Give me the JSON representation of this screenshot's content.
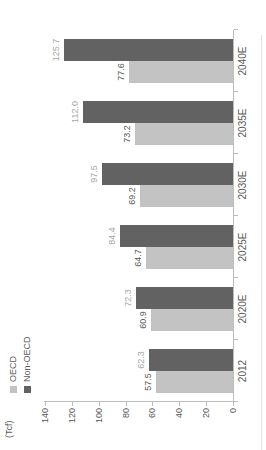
{
  "chart_data": {
    "type": "bar",
    "unit_label": "(Tcf)",
    "categories": [
      "2012",
      "2020E",
      "2025E",
      "2030E",
      "2035E",
      "2040E"
    ],
    "series": [
      {
        "name": "OECD",
        "color": "#c3c3c3",
        "label_color": "#595959",
        "values": [
          57.5,
          60.9,
          64.7,
          69.2,
          73.2,
          77.6
        ]
      },
      {
        "name": "Non-OECD",
        "color": "#626262",
        "label_color": "#a6a6a6",
        "values": [
          62.3,
          72.3,
          84.4,
          97.5,
          112.0,
          125.7
        ]
      }
    ],
    "ylim": [
      0,
      140
    ],
    "yticks": [
      0,
      20,
      40,
      60,
      80,
      100,
      120,
      140
    ],
    "grid": false,
    "legend_position": "top-left",
    "axis_color": "#bdbdbd",
    "text_color": "#595959",
    "value_label_decimals": 1
  }
}
